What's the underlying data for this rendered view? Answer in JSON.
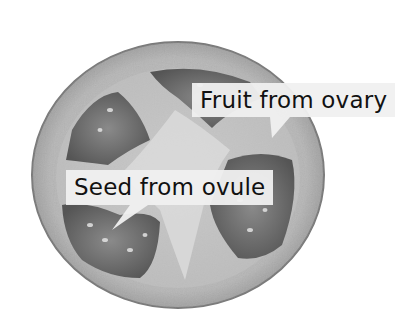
{
  "image": {
    "subject": "tomato cross-section",
    "palette": "grayscale",
    "labels": [
      {
        "id": "fruit",
        "text": "Fruit from ovary"
      },
      {
        "id": "seed",
        "text": "Seed from ovule"
      }
    ]
  }
}
